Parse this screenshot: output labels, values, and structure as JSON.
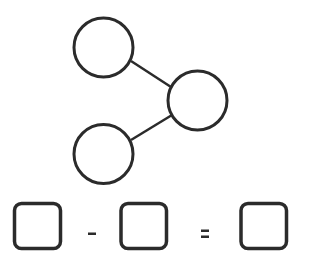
{
  "diagram": {
    "type": "number-bond",
    "stroke_color": "#2b2b2b",
    "background": "#ffffff",
    "nodes": [
      {
        "id": "part-top",
        "cx": 103.5,
        "cy": 47.5,
        "r": 30,
        "value": ""
      },
      {
        "id": "whole",
        "cx": 197.5,
        "cy": 100.5,
        "r": 30,
        "value": ""
      },
      {
        "id": "part-bottom",
        "cx": 103.5,
        "cy": 154,
        "r": 30,
        "value": ""
      }
    ],
    "edges": [
      {
        "from": "part-top",
        "to": "whole"
      },
      {
        "from": "part-bottom",
        "to": "whole"
      }
    ]
  },
  "equation": {
    "boxes": [
      {
        "x": 14,
        "y": 203,
        "w": 47,
        "h": 46,
        "value": ""
      },
      {
        "x": 121,
        "y": 203,
        "w": 46,
        "h": 46,
        "value": ""
      },
      {
        "x": 241,
        "y": 203,
        "w": 46,
        "h": 46,
        "value": ""
      }
    ],
    "operator": "-",
    "equals": "="
  }
}
